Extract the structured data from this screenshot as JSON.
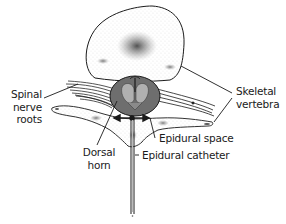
{
  "diagram": {
    "labels": {
      "spinal_nerve_roots": {
        "line1": "Spinal",
        "line2": "nerve",
        "line3": "roots"
      },
      "skeletal_vertebra": {
        "line1": "Skeletal",
        "line2": "vertebra"
      },
      "dorsal_horn": {
        "line1": "Dorsal",
        "line2": "horn"
      },
      "epidural_space": "Epidural space",
      "epidural_catheter": "Epidural catheter"
    },
    "colors": {
      "outline": "#1a1a1a",
      "cord_dark": "#6e6e6e",
      "cord_gray_matter": "#b0b0b0",
      "bone_fill": "#ffffff",
      "stipple": "#555555",
      "background": "#ffffff"
    }
  }
}
